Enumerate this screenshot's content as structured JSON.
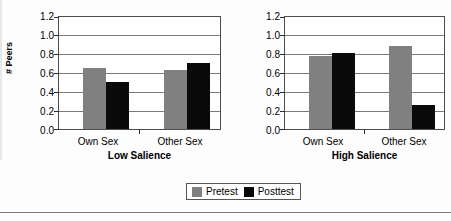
{
  "chart_data": {
    "type": "bar",
    "title": "",
    "xlabel": "",
    "ylabel": "# Peers",
    "ylim": [
      0.0,
      1.2
    ],
    "yticks": [
      "0.0",
      "0.2",
      "0.4",
      "0.6",
      "0.8",
      "1.0",
      "1.2"
    ],
    "ytick_values": [
      0.0,
      0.2,
      0.4,
      0.6,
      0.8,
      1.0,
      1.2
    ],
    "grid": true,
    "legend_position": "bottom-center",
    "categories": [
      "Own Sex",
      "Other Sex"
    ],
    "series_names": [
      "Pretest",
      "Posttest"
    ],
    "colors": {
      "pretest": "#808080",
      "posttest": "#0a0a0a"
    },
    "panels": [
      {
        "name": "Low Salience",
        "categories": [
          "Own Sex",
          "Other Sex"
        ],
        "series": [
          {
            "name": "Pretest",
            "values": [
              0.65,
              0.63
            ]
          },
          {
            "name": "Posttest",
            "values": [
              0.5,
              0.71
            ]
          }
        ]
      },
      {
        "name": "High Salience",
        "categories": [
          "Own Sex",
          "Other Sex"
        ],
        "series": [
          {
            "name": "Pretest",
            "values": [
              0.78,
              0.89
            ]
          },
          {
            "name": "Posttest",
            "values": [
              0.81,
              0.26
            ]
          }
        ]
      }
    ]
  },
  "axis": {
    "ylabel": "# Peers",
    "ticks": [
      "1.2",
      "1.0",
      "0.8",
      "0.6",
      "0.4",
      "0.2",
      "0.0"
    ]
  },
  "panel_low": {
    "title": "Low Salience",
    "cat1": "Own Sex",
    "cat2": "Other Sex"
  },
  "panel_high": {
    "title": "High Salience",
    "cat1": "Own Sex",
    "cat2": "Other Sex"
  },
  "legend": {
    "pretest": "Pretest",
    "posttest": "Posttest"
  }
}
